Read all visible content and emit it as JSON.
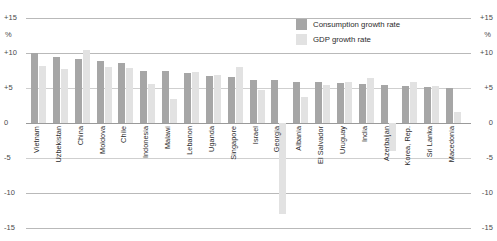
{
  "chart_data": {
    "type": "bar",
    "title": "",
    "subtitle": "",
    "xlabel": "",
    "ylabel": "%",
    "unit_label": "%",
    "ylim": [
      -15,
      15
    ],
    "yticks": [
      "+15",
      "+10",
      "+5",
      "0",
      "-5",
      "-10",
      "-15"
    ],
    "ytick_values": [
      15,
      10,
      5,
      0,
      -5,
      -10,
      -15
    ],
    "grid": true,
    "legend_position": "top-right",
    "axis_labels_both_sides": true,
    "categories": [
      "Vietnam",
      "Uzbekistan",
      "China",
      "Moldova",
      "Chile",
      "Indonesia",
      "Malawi",
      "Lebanon",
      "Uganda",
      "Singapore",
      "Israel",
      "Georgia",
      "Albania",
      "El Salvador",
      "Uruguay",
      "India",
      "Azerbaijan",
      "Korea, Rep.",
      "Sri Lanka",
      "Macedonia"
    ],
    "series": [
      {
        "name": "Consumption growth rate",
        "color": "#a6a6a6",
        "values": [
          10.0,
          9.4,
          9.1,
          8.9,
          8.6,
          7.5,
          7.4,
          7.1,
          6.7,
          6.6,
          6.2,
          6.1,
          5.9,
          5.8,
          5.7,
          5.6,
          5.4,
          5.3,
          5.1,
          5.0
        ]
      },
      {
        "name": "GDP growth rate",
        "color": "#e2e2e2",
        "values": [
          8.2,
          7.7,
          10.5,
          8.0,
          7.8,
          5.6,
          3.5,
          7.3,
          6.9,
          8.0,
          4.7,
          -13.0,
          3.7,
          5.5,
          5.8,
          6.4,
          -4.0,
          5.9,
          5.3,
          1.6
        ]
      }
    ],
    "special_notes": {
      "moldova_gdp_extends_negative_to": -13.0,
      "georgia_gdp_extends_negative_to": -13.0,
      "azerbaijan_gdp_negative_to": -4.0
    }
  },
  "legend": {
    "items": [
      {
        "label": "Consumption growth rate",
        "color": "#a6a6a6"
      },
      {
        "label": "GDP growth rate",
        "color": "#e2e2e2"
      }
    ]
  }
}
